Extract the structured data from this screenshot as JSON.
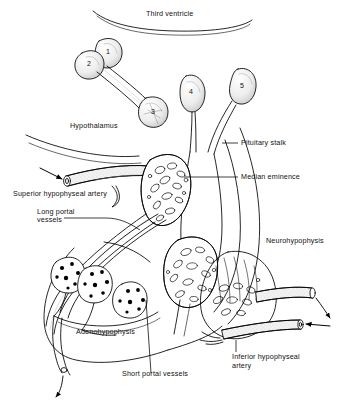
{
  "figure": {
    "style": "black-and-white stippled line drawing",
    "colors": {
      "ink": "#000000",
      "background": "#ffffff",
      "shading": "#d9d9d9",
      "stipple": "#9a9a9a"
    }
  },
  "labels": {
    "third_ventricle": "Third ventricle",
    "hypothalamus": "Hypothalamus",
    "pituitary_stalk": "Pituitary stalk",
    "median_eminence": "Median eminence",
    "superior_hypophyseal_artery": "Superior hypophyseal artery",
    "long_portal_vessels_line1": "Long portal",
    "long_portal_vessels_line2": "vessels",
    "neurohypophysis": "Neurohypophysis",
    "adenohypophysis": "Adenohypophysis",
    "short_portal_vessels": "Short portal vessels",
    "inferior_hypophyseal_artery_line1": "Inferior hypophyseal",
    "inferior_hypophyseal_artery_line2": "artery"
  },
  "nuclei": [
    {
      "key": "1",
      "number": "1"
    },
    {
      "key": "2",
      "number": "2"
    },
    {
      "key": "3",
      "number": "3"
    },
    {
      "key": "4",
      "number": "4"
    },
    {
      "key": "5",
      "number": "5"
    }
  ]
}
